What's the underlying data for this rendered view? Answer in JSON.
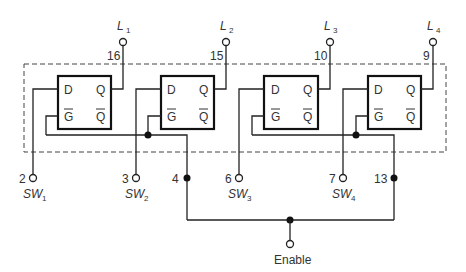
{
  "diagram": {
    "latches": [
      {
        "id": 1,
        "input_label": "D",
        "gate_label": "G",
        "q_label": "Q",
        "qbar_label": "Q",
        "output": {
          "name": "L",
          "sub": "1",
          "pin": "16"
        },
        "switch": {
          "name": "SW",
          "sub": "1",
          "pin": "2"
        }
      },
      {
        "id": 2,
        "input_label": "D",
        "gate_label": "G",
        "q_label": "Q",
        "qbar_label": "Q",
        "output": {
          "name": "L",
          "sub": "2",
          "pin": "15"
        },
        "switch": {
          "name": "SW",
          "sub": "2",
          "pin": "3"
        }
      },
      {
        "id": 3,
        "input_label": "D",
        "gate_label": "G",
        "q_label": "Q",
        "qbar_label": "Q",
        "output": {
          "name": "L",
          "sub": "3",
          "pin": "10"
        },
        "switch": {
          "name": "SW",
          "sub": "3",
          "pin": "6"
        }
      },
      {
        "id": 4,
        "input_label": "D",
        "gate_label": "G",
        "q_label": "Q",
        "qbar_label": "Q",
        "output": {
          "name": "L",
          "sub": "4",
          "pin": "9"
        },
        "switch": {
          "name": "SW",
          "sub": "4",
          "pin": "7"
        }
      }
    ],
    "enable_pins": [
      "4",
      "13"
    ],
    "enable_label": "Enable"
  }
}
